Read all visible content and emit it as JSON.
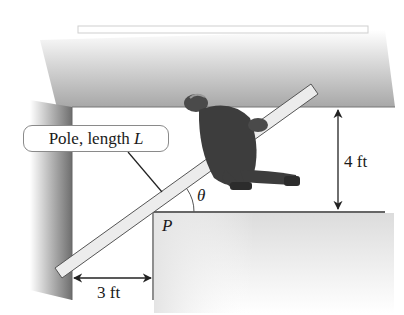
{
  "figure": {
    "callout": {
      "text": "Pole, length",
      "variable": "L"
    },
    "labels": {
      "angle": "θ",
      "corner": "P",
      "vertical_width": "4 ft",
      "horizontal_width": "3 ft"
    },
    "colors": {
      "wall_shade": "#7a7a7a",
      "pole_fill": "#e8e8e8",
      "pole_edge": "#555555",
      "line": "#333333",
      "person": "#3a3a3a"
    }
  }
}
